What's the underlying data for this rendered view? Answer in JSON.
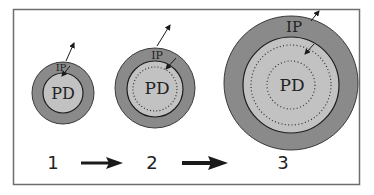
{
  "diagram": {
    "colors": {
      "frame": "#6e6e6e",
      "outer_ring": "#8a8a8a",
      "inner_disc": "#c2c2c2",
      "outline": "#1e1e1e",
      "dots": "#333333",
      "arrow": "#1a1a1a"
    },
    "stages": [
      {
        "number": "1",
        "ring_label": "IP",
        "core_label": "PD"
      },
      {
        "number": "2",
        "ring_label": "IP",
        "core_label": "PD"
      },
      {
        "number": "3",
        "ring_label": "IP",
        "core_label": "PD"
      }
    ]
  }
}
